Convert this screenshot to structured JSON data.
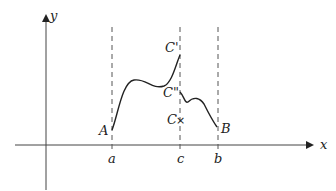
{
  "diagram": {
    "axes": {
      "x_label": "x",
      "y_label": "y"
    },
    "vertical_lines": [
      {
        "id": "a",
        "label": "a"
      },
      {
        "id": "c",
        "label": "c"
      },
      {
        "id": "b",
        "label": "b"
      }
    ],
    "points": {
      "A": "A",
      "C_prime": "C'",
      "C_double_prime": "C\"",
      "C": "C",
      "B": "B"
    },
    "marker": "×",
    "colors": {
      "stroke": "#222222",
      "axis": "#444444",
      "dashed": "#555555"
    }
  }
}
